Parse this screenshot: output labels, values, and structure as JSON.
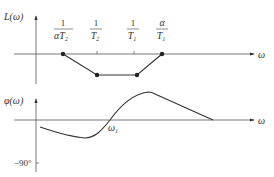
{
  "magnitude_plot": {
    "y_label": "L(ω)",
    "x_label": "ω",
    "break_labels": [
      {
        "num": "1",
        "den_pre": "αT",
        "den_sub": "2"
      },
      {
        "num": "1",
        "den_pre": "T",
        "den_sub": "2"
      },
      {
        "num": "1",
        "den_pre": "T",
        "den_sub": "1"
      },
      {
        "num": "α",
        "den_pre": "T",
        "den_sub": "1"
      }
    ]
  },
  "phase_plot": {
    "y_label": "φ(ω)",
    "x_label": "ω",
    "tick_label": "−90°",
    "crossing_label_pre": "ω",
    "crossing_label_sub": "1"
  },
  "colors": {
    "line": "#333333",
    "axis": "#555555"
  }
}
